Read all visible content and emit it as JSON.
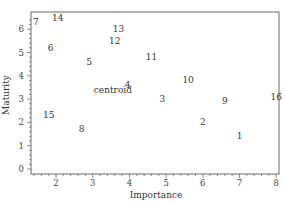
{
  "chart_data": {
    "type": "scatter",
    "title": "",
    "xlabel": "Importance",
    "ylabel": "Maturity",
    "xlim": [
      1.3,
      8.05
    ],
    "ylim": [
      -0.1,
      6.8
    ],
    "xticks": [
      2,
      3,
      4,
      5,
      6,
      7,
      8
    ],
    "yticks": [
      0,
      1,
      2,
      3,
      4,
      5,
      6
    ],
    "grid": false,
    "legend": null,
    "marker": "text-label",
    "points": [
      {
        "label": "1",
        "x": 7.0,
        "y": 1.4
      },
      {
        "label": "2",
        "x": 6.0,
        "y": 2.0
      },
      {
        "label": "3",
        "x": 4.9,
        "y": 3.0
      },
      {
        "label": "4",
        "x": 3.95,
        "y": 3.6
      },
      {
        "label": "5",
        "x": 2.9,
        "y": 4.6
      },
      {
        "label": "6",
        "x": 1.85,
        "y": 5.2
      },
      {
        "label": "7",
        "x": 1.45,
        "y": 6.3
      },
      {
        "label": "8",
        "x": 2.7,
        "y": 1.7
      },
      {
        "label": "9",
        "x": 6.6,
        "y": 2.9
      },
      {
        "label": "10",
        "x": 5.6,
        "y": 3.8
      },
      {
        "label": "11",
        "x": 4.6,
        "y": 4.8
      },
      {
        "label": "12",
        "x": 3.6,
        "y": 5.5
      },
      {
        "label": "13",
        "x": 3.7,
        "y": 6.0
      },
      {
        "label": "14",
        "x": 2.05,
        "y": 6.5
      },
      {
        "label": "15",
        "x": 1.8,
        "y": 2.3
      },
      {
        "label": "16",
        "x": 8.0,
        "y": 3.1
      },
      {
        "label": "centroid",
        "x": 3.55,
        "y": 3.4
      }
    ]
  }
}
